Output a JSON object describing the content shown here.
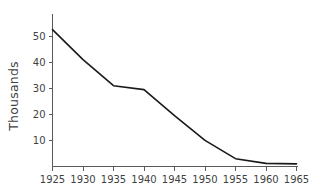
{
  "chart_data": {
    "type": "line",
    "title": "",
    "xlabel": "",
    "ylabel": "Thousands",
    "x": [
      1925,
      1930,
      1935,
      1940,
      1945,
      1950,
      1955,
      1960,
      1965
    ],
    "values": [
      52.5,
      41.0,
      31.0,
      29.5,
      19.5,
      10.0,
      3.0,
      1.2,
      1.0
    ],
    "series": [
      {
        "name": "Thousands",
        "values": [
          52.5,
          41.0,
          31.0,
          29.5,
          19.5,
          10.0,
          3.0,
          1.2,
          1.0
        ]
      }
    ],
    "xtick_labels": [
      "1925",
      "1930",
      "1935",
      "1940",
      "1945",
      "1950",
      "1955",
      "1960",
      "1965"
    ],
    "ytick_labels": [
      "10",
      "20",
      "30",
      "40",
      "50"
    ],
    "ytick_values": [
      10,
      20,
      30,
      40,
      50
    ],
    "xlim": [
      1925,
      1965
    ],
    "ylim": [
      0,
      58.5
    ],
    "grid": false,
    "legend": false,
    "line_color": "#1a1a1a",
    "axis_color": "#5a5a5a",
    "text_color": "#3f3f3f",
    "background_color": "#ffffff"
  }
}
